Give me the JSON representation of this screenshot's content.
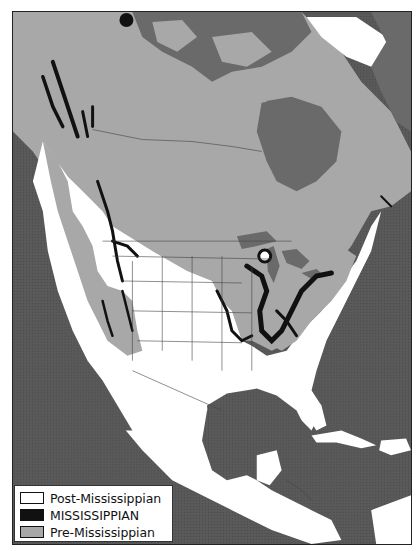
{
  "map": {
    "subject": "Distribution of Mississippian rocks in North America",
    "region": "North America, Central America and Caribbean",
    "colors": {
      "ocean": "#5a5a5a",
      "post_mississippian": "#ffffff",
      "mississippian": "#111111",
      "pre_mississippian": "#a8a8a8",
      "canadian_shield_dark": "#6e6e6e",
      "borders": "#444444"
    }
  },
  "legend": {
    "items": [
      {
        "key": "post",
        "label": "Post-Mississippian",
        "color": "#ffffff"
      },
      {
        "key": "miss",
        "label": "MISSISSIPPIAN",
        "color": "#111111"
      },
      {
        "key": "pre",
        "label": "Pre-Mississippian",
        "color": "#a8a8a8"
      }
    ]
  }
}
